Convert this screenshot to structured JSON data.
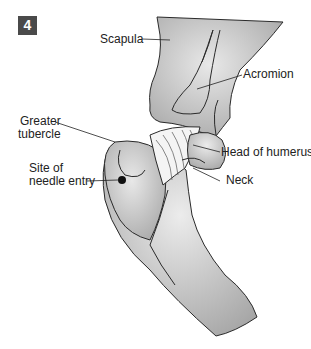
{
  "figure": {
    "number": "4",
    "labels": {
      "scapula": "Scapula",
      "acromion": "Acromion",
      "greater_tubercle_line1": "Greater",
      "greater_tubercle_line2": "tubercle",
      "site_line1": "Site of",
      "site_line2": "needle entry",
      "head_of_humerus": "Head of humerus",
      "neck": "Neck"
    },
    "colors": {
      "bone_fill": "#b5b5b5",
      "bone_highlight": "#e6e6e6",
      "outline": "#2a2a2a",
      "badge": "#4a4a4a"
    }
  }
}
